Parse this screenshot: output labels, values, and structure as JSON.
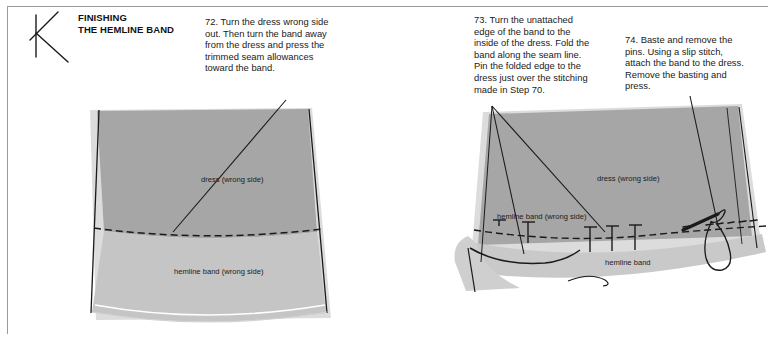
{
  "page": {
    "section_letter": "K",
    "section_heading_line1": "FINISHING",
    "section_heading_line2": "THE HEMLINE BAND"
  },
  "instructions": [
    {
      "number": "72",
      "text": "72. Turn the dress wrong side out. Then turn the band away from the dress and press the trimmed seam allowances toward the band."
    },
    {
      "number": "73",
      "text": "73. Turn the unattached edge of the band to the inside of the dress. Fold the band along the seam line. Pin the folded edge to the dress just over the stitching made in Step 70."
    },
    {
      "number": "74",
      "text": "74. Baste and remove the pins. Using a slip stitch, attach the band to the dress. Remove the basting and press."
    }
  ],
  "figures": {
    "left": {
      "labels": {
        "dress": "dress (wrong side)",
        "band": "hemline band (wrong side)"
      }
    },
    "right": {
      "labels": {
        "dress": "dress (wrong side)",
        "band_wrong": "hemline band (wrong side)",
        "band": "hemline band"
      }
    }
  },
  "colors": {
    "dress_fill": "#a6a6a6",
    "band_fill": "#c9c9c9",
    "edge_shadow": "#d6d6d6",
    "ink": "#1a1a1a",
    "rule": "#9a9a9a",
    "fold_highlight": "#ffffff"
  }
}
